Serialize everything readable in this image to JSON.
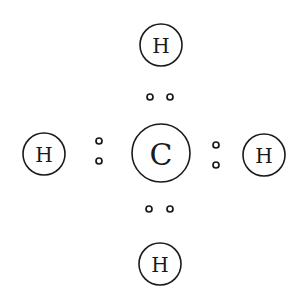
{
  "diagram": {
    "type": "lewis-dot-structure",
    "molecule": "CH4",
    "colors": {
      "stroke": "#1a1a1a",
      "background": "#ffffff"
    },
    "central_atom": {
      "symbol": "C",
      "cx": 161,
      "cy": 153,
      "r": 29
    },
    "atoms": [
      {
        "id": "top",
        "symbol": "H",
        "cx": 161,
        "cy": 45,
        "r": 21
      },
      {
        "id": "left",
        "symbol": "H",
        "cx": 44,
        "cy": 154,
        "r": 21
      },
      {
        "id": "right",
        "symbol": "H",
        "cx": 264,
        "cy": 155,
        "r": 21
      },
      {
        "id": "bottom",
        "symbol": "H",
        "cx": 160,
        "cy": 264,
        "r": 21
      }
    ],
    "electron_pairs": [
      {
        "id": "top",
        "dots": [
          {
            "cx": 150,
            "cy": 97
          },
          {
            "cx": 170,
            "cy": 97
          }
        ]
      },
      {
        "id": "left",
        "dots": [
          {
            "cx": 99,
            "cy": 141
          },
          {
            "cx": 99,
            "cy": 161
          }
        ]
      },
      {
        "id": "right",
        "dots": [
          {
            "cx": 216,
            "cy": 145
          },
          {
            "cx": 216,
            "cy": 165
          }
        ]
      },
      {
        "id": "bottom",
        "dots": [
          {
            "cx": 149,
            "cy": 209
          },
          {
            "cx": 170,
            "cy": 209
          }
        ]
      }
    ],
    "electron_radius": 3
  }
}
